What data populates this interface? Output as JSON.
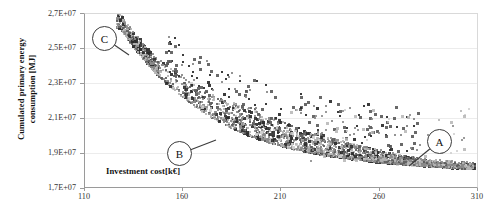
{
  "chart_data": {
    "type": "scatter",
    "title": "",
    "xlabel": "Investment cost[k€]",
    "ylabel_line1": "Cumulated primary energy",
    "ylabel_line2": "consumption [MJ]",
    "ylabel": "Cumulated primary energy consumption [MJ]",
    "xlim": [
      110,
      310
    ],
    "ylim": [
      17000000,
      27000000
    ],
    "xticks": [
      110,
      160,
      210,
      260,
      310
    ],
    "xticklabels": [
      "110",
      "160",
      "210",
      "260",
      "310"
    ],
    "yticks": [
      17000000,
      19000000,
      21000000,
      23000000,
      25000000,
      27000000
    ],
    "yticklabels": [
      "1,7E+07",
      "1,9E+07",
      "2,1E+07",
      "2,3E+07",
      "2,5E+07",
      "2,7E+07"
    ],
    "grid": "horizontal",
    "legend": "none",
    "marker": "square",
    "marker_colors": [
      "#8a8a8a",
      "#b5b5b5",
      "#5c5c5c",
      "#2b2b2b",
      "#d0d0d0"
    ],
    "annotations": [
      {
        "label": "C",
        "x": 133,
        "y": 25900000,
        "note": "upper-left extreme of the front"
      },
      {
        "label": "B",
        "x": 196,
        "y": 19450000,
        "note": "knee region of the front"
      },
      {
        "label": "A",
        "x": 300,
        "y": 18100000,
        "note": "lower-right extreme of the front"
      }
    ],
    "series": [
      {
        "name": "Pareto solutions",
        "points_front": [
          [
            128,
            26200000
          ],
          [
            130,
            25800000
          ],
          [
            132,
            25500000
          ],
          [
            134,
            25200000
          ],
          [
            137,
            24800000
          ],
          [
            140,
            24400000
          ],
          [
            143,
            24000000
          ],
          [
            146,
            23600000
          ],
          [
            150,
            23200000
          ],
          [
            154,
            22800000
          ],
          [
            158,
            22400000
          ],
          [
            162,
            22050000
          ],
          [
            166,
            21700000
          ],
          [
            170,
            21400000
          ],
          [
            175,
            21050000
          ],
          [
            180,
            20750000
          ],
          [
            185,
            20450000
          ],
          [
            190,
            20200000
          ],
          [
            196,
            19950000
          ],
          [
            202,
            19700000
          ],
          [
            208,
            19500000
          ],
          [
            214,
            19320000
          ],
          [
            220,
            19160000
          ],
          [
            227,
            19010000
          ],
          [
            234,
            18880000
          ],
          [
            241,
            18760000
          ],
          [
            248,
            18660000
          ],
          [
            255,
            18570000
          ],
          [
            262,
            18490000
          ],
          [
            269,
            18420000
          ],
          [
            276,
            18360000
          ],
          [
            283,
            18300000
          ],
          [
            290,
            18250000
          ],
          [
            297,
            18200000
          ],
          [
            303,
            18160000
          ]
        ],
        "scatter_spread_note": "Thousands of near-front solutions form a band about 0.4E+07 thick above the front, with sparse outliers up to 0.9E+07 above it in the mid-range."
      }
    ]
  }
}
